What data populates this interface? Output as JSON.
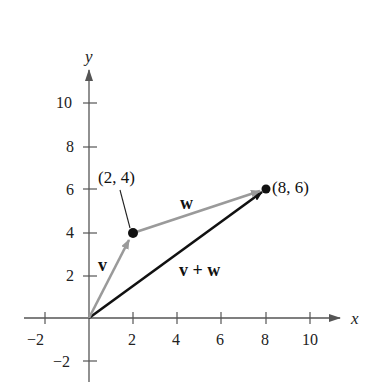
{
  "diagram": {
    "type": "vector-addition",
    "axes": {
      "x_label": "x",
      "y_label": "y",
      "x_ticks": [
        "−2",
        "2",
        "4",
        "6",
        "8",
        "10"
      ],
      "y_ticks": [
        "−2",
        "2",
        "4",
        "6",
        "8",
        "10"
      ]
    },
    "points": [
      {
        "label": "(2, 4)",
        "x": 2,
        "y": 4
      },
      {
        "label": "(8, 6)",
        "x": 8,
        "y": 6
      }
    ],
    "vectors": [
      {
        "label": "v",
        "from": [
          0,
          0
        ],
        "to": [
          2,
          4
        ],
        "color": "#9a9a9a"
      },
      {
        "label": "w",
        "from": [
          2,
          4
        ],
        "to": [
          8,
          6
        ],
        "color": "#9a9a9a"
      },
      {
        "label": "v + w",
        "from": [
          0,
          0
        ],
        "to": [
          8,
          6
        ],
        "color": "#111111"
      }
    ]
  }
}
